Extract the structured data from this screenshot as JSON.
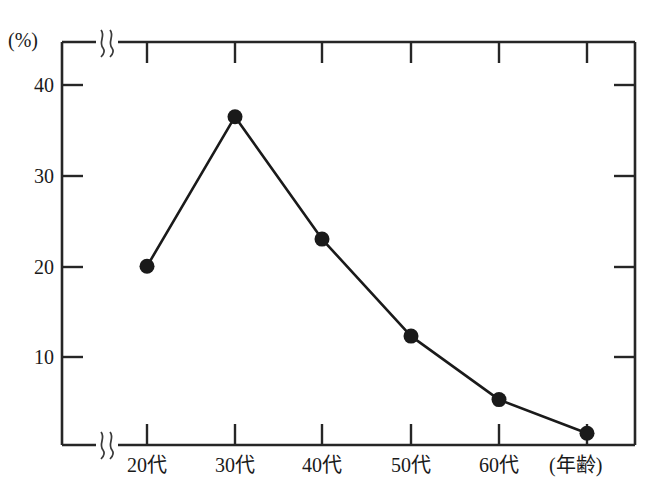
{
  "chart_data": {
    "type": "line",
    "title": "",
    "subtitle": "",
    "xlabel": "(年齢)",
    "ylabel": "(%)",
    "categories": [
      "20代",
      "30代",
      "40代",
      "50代",
      "60代",
      ""
    ],
    "values": [
      20.0,
      36.5,
      23.0,
      12.3,
      5.3,
      1.6
    ],
    "series": [
      {
        "name": "",
        "values": [
          20.0,
          36.5,
          23.0,
          12.3,
          5.3,
          1.6
        ]
      }
    ],
    "ytick_labels": [
      "10",
      "20",
      "30",
      "40"
    ],
    "ytick_values": [
      10,
      20,
      30,
      40
    ],
    "ylim": [
      0,
      44.7
    ],
    "grid": false,
    "legend": "none",
    "axis_break_x": true,
    "axis_break_y": true,
    "marker": "filled-circle",
    "line_color": "#1a1a1a",
    "marker_color": "#1a1a1a",
    "frame_color": "#262626",
    "background_color": "#ffffff"
  },
  "axes": {
    "y_unit_label": "(%)",
    "x_axis_title": "(年齢)"
  },
  "ticks": {
    "y": [
      {
        "label": "40",
        "value": 40
      },
      {
        "label": "30",
        "value": 30
      },
      {
        "label": "20",
        "value": 20
      },
      {
        "label": "10",
        "value": 10
      }
    ],
    "x": [
      {
        "label": "20代"
      },
      {
        "label": "30代"
      },
      {
        "label": "40代"
      },
      {
        "label": "50代"
      },
      {
        "label": "60代"
      }
    ]
  }
}
